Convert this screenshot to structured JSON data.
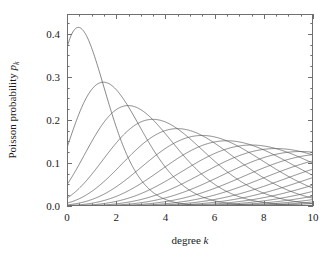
{
  "chart_data": {
    "type": "line",
    "title": "",
    "xlabel": "degree  k",
    "xlabel_text": "degree",
    "xlabel_symbol": "k",
    "ylabel": "Poisson probability p",
    "ylabel_text": "Poisson probability",
    "ylabel_symbol": "p",
    "ylabel_subscript": "k",
    "xlim": [
      0,
      10
    ],
    "ylim": [
      0,
      0.4465
    ],
    "xticks": [
      0,
      2,
      4,
      6,
      8,
      10
    ],
    "xticklabels": [
      "0",
      "2",
      "4",
      "6",
      "8",
      "10"
    ],
    "x_minor_tick_step": 0.5,
    "yticks": [
      0.0,
      0.1,
      0.2,
      0.3,
      0.4
    ],
    "yticklabels": [
      "0.0",
      "0.1",
      "0.2",
      "0.3",
      "0.4"
    ],
    "y_minor_tick_step": 0.025,
    "grid": false,
    "legend": null,
    "line_color": "#555555",
    "axis_color": "#6f6f6f",
    "background": "#ffffff",
    "series": [
      {
        "name": "c = 1",
        "mean": 1,
        "peak_x": 0.46,
        "peak_y": 0.4145,
        "value_at_0": 0.368,
        "value_at_10": 0.0001
      },
      {
        "name": "c = 2",
        "mean": 2,
        "peak_x": 1.46,
        "peak_y": 0.2888,
        "value_at_0": 0.135,
        "value_at_10": 0.0038
      },
      {
        "name": "c = 3",
        "mean": 3,
        "peak_x": 2.46,
        "peak_y": 0.2373,
        "value_at_0": 0.05,
        "value_at_10": 0.0216
      },
      {
        "name": "c = 4",
        "mean": 4,
        "peak_x": 3.46,
        "peak_y": 0.2065,
        "value_at_0": 0.018,
        "value_at_10": 0.0529
      },
      {
        "name": "c = 5",
        "mean": 5,
        "peak_x": 4.46,
        "peak_y": 0.1854,
        "value_at_0": 0.007,
        "value_at_10": 0.0881
      },
      {
        "name": "c = 6",
        "mean": 6,
        "peak_x": 5.46,
        "peak_y": 0.1697,
        "value_at_0": 0.002,
        "value_at_10": 0.1157
      },
      {
        "name": "c = 7",
        "mean": 7,
        "peak_x": 6.46,
        "peak_y": 0.1574,
        "value_at_0": 0.001,
        "value_at_10": 0.1304
      },
      {
        "name": "c = 8",
        "mean": 8,
        "peak_x": 7.46,
        "peak_y": 0.1475,
        "value_at_0": 0.0,
        "value_at_10": 0.1326
      },
      {
        "name": "c = 9",
        "mean": 9,
        "peak_x": 8.46,
        "peak_y": 0.1392,
        "value_at_0": 0.0,
        "value_at_10": 0.1251
      },
      {
        "name": "c = 10",
        "mean": 10,
        "peak_x": 9.46,
        "peak_y": 0.1322,
        "value_at_0": 0.0,
        "value_at_10": 0.1126
      },
      {
        "name": "c = 11",
        "mean": 11,
        "peak_x": 10.0,
        "peak_y": 0.1262,
        "value_at_0": 0.0,
        "value_at_10": 0.0976
      },
      {
        "name": "c = 12",
        "mean": 12,
        "peak_x": 10.0,
        "peak_y": 0.121,
        "value_at_0": 0.0,
        "value_at_10": 0.0829
      },
      {
        "name": "c = 13",
        "mean": 13,
        "peak_x": 10.0,
        "peak_y": 0.1163,
        "value_at_0": 0.0,
        "value_at_10": 0.0685
      },
      {
        "name": "c = 14",
        "mean": 14,
        "peak_x": 10.0,
        "peak_y": 0.1121,
        "value_at_0": 0.0,
        "value_at_10": 0.0554
      },
      {
        "name": "c = 15",
        "mean": 15,
        "peak_x": 10.0,
        "peak_y": 0.1083,
        "value_at_0": 0.0,
        "value_at_10": 0.0439
      },
      {
        "name": "c = 16",
        "mean": 16,
        "peak_x": 10.0,
        "peak_y": 0.1049,
        "value_at_0": 0.0,
        "value_at_10": 0.0341
      },
      {
        "name": "c = 17",
        "mean": 17,
        "peak_x": 10.0,
        "peak_y": 0.1018,
        "value_at_0": 0.0,
        "value_at_10": 0.026
      },
      {
        "name": "c = 18",
        "mean": 18,
        "peak_x": 10.0,
        "peak_y": 0.0989,
        "value_at_0": 0.0,
        "value_at_10": 0.0195
      },
      {
        "name": "c = 19",
        "mean": 19,
        "peak_x": 10.0,
        "peak_y": 0.0963,
        "value_at_0": 0.0,
        "value_at_10": 0.0143
      },
      {
        "name": "c = 20",
        "mean": 20,
        "peak_x": 10.0,
        "peak_y": 0.0938,
        "value_at_0": 0.0,
        "value_at_10": 0.0103
      }
    ],
    "plot_box": {
      "left": 67,
      "top": 14,
      "right": 313,
      "bottom": 206
    }
  }
}
